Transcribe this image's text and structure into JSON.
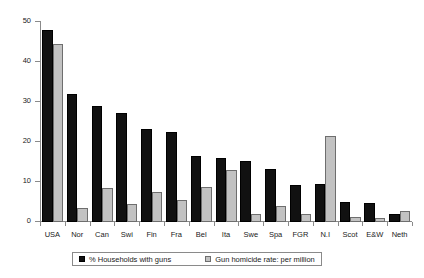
{
  "chart_data": {
    "type": "bar",
    "title": "",
    "xlabel": "",
    "ylabel": "",
    "ylim": [
      0,
      50
    ],
    "yticks": [
      0,
      10,
      20,
      30,
      40,
      50
    ],
    "grid": false,
    "legend_position": "bottom",
    "categories": [
      "USA",
      "Nor",
      "Can",
      "Swi",
      "Fin",
      "Fra",
      "Bel",
      "Ita",
      "Swe",
      "Spa",
      "FGR",
      "N.I",
      "Scot",
      "E&W",
      "Neth"
    ],
    "series": [
      {
        "name": "% Households with guns",
        "color": "#111111",
        "values": [
          48,
          32,
          29,
          27.3,
          23.3,
          22.6,
          16.6,
          16,
          15.3,
          13.2,
          9.2,
          9.4,
          4.9,
          4.7,
          1.9
        ]
      },
      {
        "name": "Gun homicide rate: per million",
        "color": "#c2c2c2",
        "values": [
          44.6,
          3.5,
          8.5,
          4.6,
          7.4,
          5.6,
          8.8,
          13.1,
          2.1,
          3.9,
          2,
          21.4,
          1.3,
          1,
          2.7
        ]
      }
    ]
  },
  "legend": {
    "entries": [
      {
        "label": "% Households with guns",
        "swatch": "primary"
      },
      {
        "label": "Gun homicide rate: per million",
        "swatch": "secondary"
      }
    ]
  },
  "icons": {
    "legend_swatch_primary": "filled-square-icon",
    "legend_swatch_secondary": "hatched-square-icon"
  }
}
